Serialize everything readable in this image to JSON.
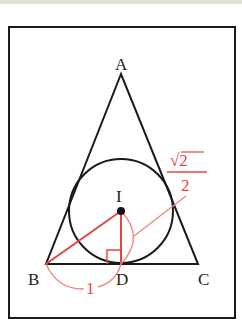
{
  "figure": {
    "type": "geometry",
    "points": {
      "A": "A",
      "B": "B",
      "C": "C",
      "D": "D",
      "I": "I"
    },
    "annotations": {
      "BD_length": "1",
      "ID_length_numerator": "√2",
      "ID_length_denominator": "2"
    },
    "colors": {
      "line": "#1a1a1a",
      "accent": "#e8453c",
      "accent_light": "#f08a80"
    }
  }
}
